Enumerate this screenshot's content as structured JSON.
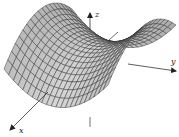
{
  "figure": {
    "type": "3d-surface-plot",
    "surface": {
      "name": "saddle",
      "equation_form": "z = y^2 - x^2",
      "mesh_rows": 18,
      "mesh_cols": 22,
      "fill_color": "#c8c8c8",
      "grid_color": "#2a2a2a"
    },
    "axes": {
      "color": "#333333",
      "x": {
        "label": "x"
      },
      "y": {
        "label": "y"
      },
      "z": {
        "label": "z"
      }
    }
  }
}
